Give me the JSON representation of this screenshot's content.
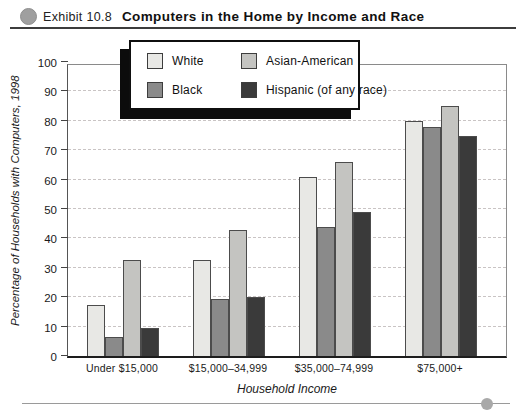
{
  "header": {
    "exhibit_label": "Exhibit 10.8",
    "title": "Computers in the Home by Income and Race"
  },
  "chart_data": {
    "type": "bar",
    "categories": [
      "Under $15,000",
      "$15,000–34,999",
      "$35,000–74,999",
      "$75,000+"
    ],
    "series": [
      {
        "name": "White",
        "color": "#e8e8e5",
        "values": [
          17.5,
          32.5,
          61,
          80
        ]
      },
      {
        "name": "Black",
        "color": "#8a8a8a",
        "values": [
          6.5,
          19.5,
          44,
          78
        ]
      },
      {
        "name": "Asian-American",
        "color": "#c4c4c1",
        "values": [
          32.5,
          43,
          66,
          85
        ]
      },
      {
        "name": "Hispanic (of any race)",
        "color": "#3a3a3a",
        "values": [
          9.5,
          20,
          49,
          75
        ]
      }
    ],
    "title": "Computers in the Home by Income and Race",
    "xlabel": "Household Income",
    "ylabel": "Percentage of Households with Computers, 1998",
    "ylim": [
      0,
      100
    ],
    "ytick_step": 10,
    "grid": "horizontal-dashed",
    "legend_position": "top-center"
  },
  "icons": {
    "header_bullet": "gray-circle",
    "footer_bullet": "gray-circle"
  },
  "colors": {
    "grid": "#c9c4c4",
    "axis": "#1d1d1d",
    "rule": "#3c3c3c"
  }
}
